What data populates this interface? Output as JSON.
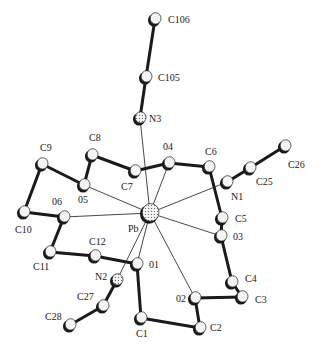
{
  "colors": {
    "ink": "#1a1a1a",
    "atom_fill": "#f4f4f4",
    "label": "#222222"
  },
  "atoms": [
    {
      "id": "C106",
      "x": 155,
      "y": 19,
      "r": 6,
      "type": "C",
      "label": "C106",
      "lx": 168,
      "ly": 23
    },
    {
      "id": "C105",
      "x": 146,
      "y": 77,
      "r": 6,
      "type": "C",
      "label": "C105",
      "lx": 158,
      "ly": 81
    },
    {
      "id": "N3",
      "x": 140,
      "y": 118,
      "r": 6,
      "type": "N",
      "label": "N3",
      "lx": 149,
      "ly": 122
    },
    {
      "id": "C8",
      "x": 92,
      "y": 155,
      "r": 6,
      "type": "C",
      "label": "C8",
      "lx": 89,
      "ly": 141
    },
    {
      "id": "C9",
      "x": 42,
      "y": 164,
      "r": 6,
      "type": "C",
      "label": "C9",
      "lx": 40,
      "ly": 151
    },
    {
      "id": "O5",
      "x": 84,
      "y": 185,
      "r": 6,
      "type": "O",
      "label": "05",
      "lx": 78,
      "ly": 203
    },
    {
      "id": "C7",
      "x": 135,
      "y": 171,
      "r": 6,
      "type": "C",
      "label": "C7",
      "lx": 121,
      "ly": 190
    },
    {
      "id": "O4",
      "x": 169,
      "y": 163,
      "r": 6,
      "type": "O",
      "label": "04",
      "lx": 163,
      "ly": 150
    },
    {
      "id": "C6",
      "x": 209,
      "y": 167,
      "r": 6,
      "type": "C",
      "label": "C6",
      "lx": 205,
      "ly": 155
    },
    {
      "id": "N1",
      "x": 227,
      "y": 182,
      "r": 6,
      "type": "C",
      "label": "N1",
      "lx": 231,
      "ly": 200
    },
    {
      "id": "C25",
      "x": 250,
      "y": 168,
      "r": 6,
      "type": "C",
      "label": "C25",
      "lx": 256,
      "ly": 185
    },
    {
      "id": "C26",
      "x": 285,
      "y": 146,
      "r": 6,
      "type": "C",
      "label": "C26",
      "lx": 288,
      "ly": 168
    },
    {
      "id": "C5",
      "x": 222,
      "y": 218,
      "r": 6,
      "type": "C",
      "label": "C5",
      "lx": 235,
      "ly": 222
    },
    {
      "id": "O3",
      "x": 221,
      "y": 236,
      "r": 6,
      "type": "O",
      "label": "03",
      "lx": 233,
      "ly": 240
    },
    {
      "id": "C4",
      "x": 232,
      "y": 282,
      "r": 6,
      "type": "C",
      "label": "C4",
      "lx": 245,
      "ly": 282
    },
    {
      "id": "C3",
      "x": 242,
      "y": 297,
      "r": 6,
      "type": "C",
      "label": "C3",
      "lx": 255,
      "ly": 303
    },
    {
      "id": "Pb",
      "x": 150,
      "y": 213,
      "r": 9,
      "type": "Pb",
      "label": "Pb",
      "lx": 128,
      "ly": 232
    },
    {
      "id": "C10",
      "x": 24,
      "y": 212,
      "r": 6,
      "type": "C",
      "label": "C10",
      "lx": 15,
      "ly": 233
    },
    {
      "id": "O6",
      "x": 64,
      "y": 217,
      "r": 6,
      "type": "O",
      "label": "06",
      "lx": 52,
      "ly": 205
    },
    {
      "id": "C11",
      "x": 50,
      "y": 252,
      "r": 6,
      "type": "C",
      "label": "C11",
      "lx": 33,
      "ly": 270
    },
    {
      "id": "C12",
      "x": 95,
      "y": 256,
      "r": 6,
      "type": "C",
      "label": "C12",
      "lx": 89,
      "ly": 245
    },
    {
      "id": "O1",
      "x": 137,
      "y": 264,
      "r": 6,
      "type": "O",
      "label": "01",
      "lx": 149,
      "ly": 268
    },
    {
      "id": "N2",
      "x": 117,
      "y": 280,
      "r": 6,
      "type": "N",
      "label": "N2",
      "lx": 95,
      "ly": 280
    },
    {
      "id": "C27",
      "x": 103,
      "y": 306,
      "r": 6,
      "type": "C",
      "label": "C27",
      "lx": 77,
      "ly": 300
    },
    {
      "id": "C28",
      "x": 70,
      "y": 325,
      "r": 6,
      "type": "C",
      "label": "C28",
      "lx": 45,
      "ly": 320
    },
    {
      "id": "C1",
      "x": 141,
      "y": 318,
      "r": 6,
      "type": "C",
      "label": "C1",
      "lx": 136,
      "ly": 337
    },
    {
      "id": "O2",
      "x": 195,
      "y": 298,
      "r": 6,
      "type": "O",
      "label": "02",
      "lx": 176,
      "ly": 302
    },
    {
      "id": "C2",
      "x": 200,
      "y": 328,
      "r": 6,
      "type": "C",
      "label": "C2",
      "lx": 210,
      "ly": 331
    }
  ],
  "bonds": [
    {
      "a": "C106",
      "b": "C105",
      "w": 3
    },
    {
      "a": "C105",
      "b": "N3",
      "w": 3
    },
    {
      "a": "C8",
      "b": "C7",
      "w": 3
    },
    {
      "a": "C8",
      "b": "O5",
      "w": 3
    },
    {
      "a": "C9",
      "b": "O5",
      "w": 3
    },
    {
      "a": "C9",
      "b": "C10",
      "w": 3
    },
    {
      "a": "C7",
      "b": "O4",
      "w": 3
    },
    {
      "a": "O4",
      "b": "C6",
      "w": 3
    },
    {
      "a": "C6",
      "b": "C5",
      "w": 3
    },
    {
      "a": "N1",
      "b": "C25",
      "w": 3
    },
    {
      "a": "C25",
      "b": "C26",
      "w": 3
    },
    {
      "a": "C5",
      "b": "O3",
      "w": 3
    },
    {
      "a": "O3",
      "b": "C4",
      "w": 3
    },
    {
      "a": "C4",
      "b": "C3",
      "w": 3
    },
    {
      "a": "C3",
      "b": "O2",
      "w": 3
    },
    {
      "a": "O2",
      "b": "C2",
      "w": 3
    },
    {
      "a": "C2",
      "b": "C1",
      "w": 3
    },
    {
      "a": "C1",
      "b": "O1",
      "w": 3
    },
    {
      "a": "O1",
      "b": "C12",
      "w": 3
    },
    {
      "a": "C12",
      "b": "C11",
      "w": 3
    },
    {
      "a": "C11",
      "b": "O6",
      "w": 3
    },
    {
      "a": "O6",
      "b": "C10",
      "w": 3
    },
    {
      "a": "N2",
      "b": "C27",
      "w": 3
    },
    {
      "a": "C27",
      "b": "C28",
      "w": 3
    },
    {
      "a": "Pb",
      "b": "N3",
      "w": 0.8
    },
    {
      "a": "Pb",
      "b": "O4",
      "w": 0.8
    },
    {
      "a": "Pb",
      "b": "O5",
      "w": 0.8
    },
    {
      "a": "Pb",
      "b": "O6",
      "w": 0.8
    },
    {
      "a": "Pb",
      "b": "N1",
      "w": 0.8
    },
    {
      "a": "Pb",
      "b": "O3",
      "w": 0.8
    },
    {
      "a": "Pb",
      "b": "O1",
      "w": 0.8
    },
    {
      "a": "Pb",
      "b": "O2",
      "w": 0.8
    },
    {
      "a": "Pb",
      "b": "N2",
      "w": 0.8
    }
  ]
}
